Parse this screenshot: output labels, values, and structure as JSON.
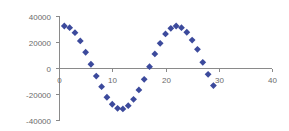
{
  "chart_data": {
    "type": "scatter",
    "title": "",
    "xlabel": "",
    "ylabel": "",
    "xlim": [
      0,
      40
    ],
    "ylim": [
      -40000,
      40000
    ],
    "x_ticks": [
      0,
      10,
      20,
      30,
      40
    ],
    "x_tick_labels": [
      "0",
      "10",
      "20",
      "30",
      "40"
    ],
    "y_ticks": [
      40000,
      20000,
      0,
      -20000,
      -40000
    ],
    "y_tick_labels": [
      "40000",
      "20000",
      "0",
      "-20000",
      "-40000"
    ],
    "grid": false,
    "legend": null,
    "marker": "diamond",
    "marker_color": "#3c4a9c",
    "series": [
      {
        "name": "Series 1",
        "x": [
          1,
          2,
          3,
          4,
          5,
          6,
          7,
          8,
          9,
          10,
          11,
          12,
          13,
          14,
          15,
          16,
          17,
          18,
          19,
          20,
          21,
          22,
          23,
          24,
          25,
          26,
          27,
          28,
          29
        ],
        "y": [
          32300,
          31000,
          27200,
          20800,
          12100,
          2900,
          -6200,
          -14400,
          -22500,
          -27900,
          -31000,
          -31500,
          -29000,
          -24100,
          -16900,
          -8700,
          1000,
          10800,
          19000,
          26200,
          30500,
          32300,
          31000,
          27500,
          21500,
          14400,
          4400,
          -4900,
          -13500
        ]
      }
    ]
  }
}
